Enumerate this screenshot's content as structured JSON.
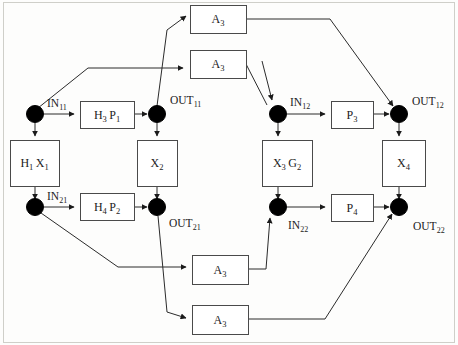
{
  "diagram": {
    "canvas": {
      "width": 458,
      "height": 345,
      "background": "#fdfdfc"
    },
    "colors": {
      "box_stroke": "#4a4a4a",
      "box_fill": "#ffffff",
      "edge_stroke": "#2b2b2b",
      "node_fill": "#000000",
      "frame_stroke": "#cfcfc9",
      "text": "#222222"
    },
    "boxes": [
      {
        "id": "a3_top1",
        "label": "A",
        "sub": "3",
        "x": 190,
        "y": 5,
        "w": 56,
        "h": 28
      },
      {
        "id": "a3_top2",
        "label": "A",
        "sub": "3",
        "x": 190,
        "y": 50,
        "w": 56,
        "h": 28
      },
      {
        "id": "h3p1",
        "label": "H",
        "sub": "3",
        "label2": "P",
        "sub2": "1",
        "x": 80,
        "y": 101,
        "w": 54,
        "h": 27
      },
      {
        "id": "p3",
        "label": "P",
        "sub": "3",
        "x": 331,
        "y": 101,
        "w": 42,
        "h": 27
      },
      {
        "id": "h1x1",
        "label": "H",
        "sub": "1",
        "label2": "X",
        "sub2": "1",
        "x": 10,
        "y": 140,
        "w": 49,
        "h": 46
      },
      {
        "id": "x2",
        "label": "X",
        "sub": "2",
        "x": 137,
        "y": 140,
        "w": 40,
        "h": 46
      },
      {
        "id": "x3g2",
        "label": "X",
        "sub": "3",
        "label2": "G",
        "sub2": "2",
        "x": 262,
        "y": 140,
        "w": 50,
        "h": 46
      },
      {
        "id": "x4",
        "label": "X",
        "sub": "4",
        "x": 382,
        "y": 140,
        "w": 43,
        "h": 46
      },
      {
        "id": "h4p2",
        "label": "H",
        "sub": "4",
        "label2": "P",
        "sub2": "2",
        "x": 80,
        "y": 193,
        "w": 54,
        "h": 27
      },
      {
        "id": "p4",
        "label": "P",
        "sub": "4",
        "x": 331,
        "y": 194,
        "w": 42,
        "h": 27
      },
      {
        "id": "a3_bot1",
        "label": "A",
        "sub": "3",
        "x": 192,
        "y": 255,
        "w": 56,
        "h": 29
      },
      {
        "id": "a3_bot2",
        "label": "A",
        "sub": "3",
        "x": 192,
        "y": 305,
        "w": 56,
        "h": 29
      }
    ],
    "nodes": [
      {
        "id": "in11",
        "cx": 35,
        "cy": 114,
        "r": 8.5,
        "label": "IN",
        "sub": "11",
        "lx": 47,
        "ly": 107,
        "anchor": "start"
      },
      {
        "id": "out11",
        "cx": 157,
        "cy": 114,
        "r": 8.5,
        "label": "OUT",
        "sub": "11",
        "lx": 170,
        "ly": 104,
        "anchor": "start"
      },
      {
        "id": "in12",
        "cx": 278,
        "cy": 114,
        "r": 8.5,
        "label": "IN",
        "sub": "12",
        "lx": 290,
        "ly": 106,
        "anchor": "start"
      },
      {
        "id": "out12",
        "cx": 399,
        "cy": 114,
        "r": 8.5,
        "label": "OUT",
        "sub": "12",
        "lx": 412,
        "ly": 105,
        "anchor": "start"
      },
      {
        "id": "in21",
        "cx": 35,
        "cy": 207,
        "r": 8.5,
        "label": "IN",
        "sub": "21",
        "lx": 47,
        "ly": 200,
        "anchor": "start"
      },
      {
        "id": "out21",
        "cx": 157,
        "cy": 207,
        "r": 8.5,
        "label": "OUT",
        "sub": "21",
        "lx": 169,
        "ly": 227,
        "anchor": "start"
      },
      {
        "id": "in22",
        "cx": 278,
        "cy": 207,
        "r": 8.5,
        "label": "IN",
        "sub": "22",
        "lx": 288,
        "ly": 229,
        "anchor": "start"
      },
      {
        "id": "out22",
        "cx": 399,
        "cy": 207,
        "r": 8.5,
        "label": "OUT",
        "sub": "22",
        "lx": 413,
        "ly": 230,
        "anchor": "start"
      }
    ],
    "edges": [
      {
        "id": "e-in11-h3p1",
        "d": "M 44 114 L 74 114",
        "arrow": true
      },
      {
        "id": "e-h3p1-out11",
        "d": "M 134 114 L 147 114",
        "arrow": true
      },
      {
        "id": "e-in11-x2box",
        "d": "M 35 123 L 35 136",
        "arrow": true
      },
      {
        "id": "e-out11-x2",
        "d": "M 157 123 L 157 136",
        "arrow": true
      },
      {
        "id": "e-in11-up",
        "d": "M 38 108 L 88 68 L 183 68",
        "arrow": true
      },
      {
        "id": "e-out11-up",
        "d": "M 157 106 L 167 30 L 186 16",
        "arrow": true
      },
      {
        "id": "e-a3top2-in12",
        "d": "M 246 64 L 267 105",
        "arrow": false
      },
      {
        "id": "e-in12-arr",
        "d": "M 262 61 L 272 100",
        "arrow": true
      },
      {
        "id": "e-a3top1-out12",
        "d": "M 246 19 L 330 19 L 393 106",
        "arrow": true
      },
      {
        "id": "e-in12-p3",
        "d": "M 287 114 L 325 114",
        "arrow": true
      },
      {
        "id": "e-p3-out12",
        "d": "M 373 114 L 389 114",
        "arrow": true
      },
      {
        "id": "e-in12-x3g2",
        "d": "M 278 123 L 278 136",
        "arrow": true
      },
      {
        "id": "e-out12-x4",
        "d": "M 399 123 L 399 136",
        "arrow": true
      },
      {
        "id": "e-h1x1-in21",
        "d": "M 35 186 L 35 199",
        "arrow": true
      },
      {
        "id": "e-in21-h4p2",
        "d": "M 44 207 L 74 207",
        "arrow": true
      },
      {
        "id": "e-h4p2-out21",
        "d": "M 134 207 L 147 207",
        "arrow": true
      },
      {
        "id": "e-x2-out21",
        "d": "M 157 186 L 157 199",
        "arrow": true
      },
      {
        "id": "e-in21-a3b1",
        "d": "M 41 213 L 118 267 L 186 267",
        "arrow": true
      },
      {
        "id": "e-out21-a3b2",
        "d": "M 158 216 L 167 312 L 186 318",
        "arrow": true
      },
      {
        "id": "e-x3g2-in22",
        "d": "M 278 186 L 278 199",
        "arrow": true
      },
      {
        "id": "e-in22-p4",
        "d": "M 287 207 L 325 207",
        "arrow": true
      },
      {
        "id": "e-p4-out22",
        "d": "M 373 207 L 389 207",
        "arrow": true
      },
      {
        "id": "e-x4-out22",
        "d": "M 399 186 L 399 199",
        "arrow": true
      },
      {
        "id": "e-a3b1-in22",
        "d": "M 248 269 L 266 269 L 270 218",
        "arrow": true
      },
      {
        "id": "e-a3b2-out22",
        "d": "M 248 319 L 325 319 L 392 214",
        "arrow": true
      }
    ],
    "frame": {
      "x": 3,
      "y": 2,
      "w": 452,
      "h": 341
    }
  }
}
